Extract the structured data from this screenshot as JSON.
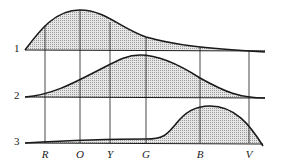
{
  "diagram": {
    "rows": [
      {
        "label": "1",
        "baseline_y": 50
      },
      {
        "label": "2",
        "baseline_y": 97
      },
      {
        "label": "3",
        "baseline_y": 143
      }
    ],
    "bands": [
      {
        "label": "R",
        "x": 45
      },
      {
        "label": "O",
        "x": 80
      },
      {
        "label": "Y",
        "x": 110
      },
      {
        "label": "G",
        "x": 146
      },
      {
        "label": "B",
        "x": 200
      },
      {
        "label": "V",
        "x": 249
      }
    ],
    "colors": {
      "stroke": "#1a1a1a",
      "fill": "#d9d9d9"
    }
  }
}
